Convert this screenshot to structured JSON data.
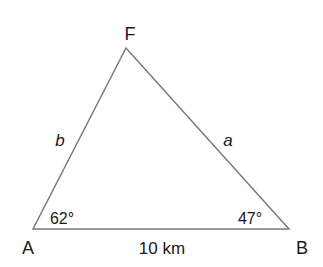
{
  "diagram": {
    "type": "triangle",
    "stroke_color": "#7a7a7a",
    "text_color": "#1a1a1a",
    "vertices": {
      "F": {
        "label": "F",
        "x": 126,
        "y": 48
      },
      "A": {
        "label": "A",
        "x": 33,
        "y": 229
      },
      "B": {
        "label": "B",
        "x": 289,
        "y": 229
      }
    },
    "sides": {
      "AF": {
        "label": "b"
      },
      "BF": {
        "label": "a"
      },
      "AB": {
        "label": "10 km"
      }
    },
    "angles": {
      "A": {
        "label": "62°"
      },
      "B": {
        "label": "47°"
      }
    }
  }
}
